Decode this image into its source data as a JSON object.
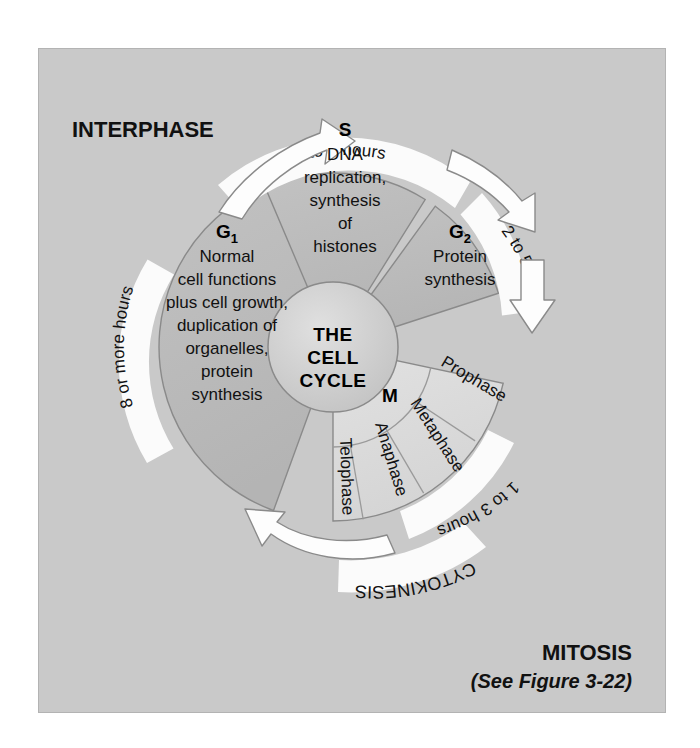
{
  "figure": {
    "background_color": "#c9c9c9",
    "panel_border_color": "#b3b3b3"
  },
  "headings": {
    "interphase": "INTERPHASE",
    "mitosis": "MITOSIS",
    "mitosis_note": "(See Figure 3-22)",
    "cytokinesis": "CYTOKINESIS"
  },
  "hub": {
    "line1": "THE",
    "line2": "CELL",
    "line3": "CYCLE"
  },
  "phases": {
    "g1": {
      "letter": "G",
      "subscript": "1",
      "duration": "8 or more hours",
      "lines": [
        "Normal",
        "cell functions",
        "plus cell growth,",
        "duplication of",
        "organelles,",
        "protein",
        "synthesis"
      ]
    },
    "s": {
      "letter": "S",
      "subscript": "",
      "duration": "6 to 8 hours",
      "lines": [
        "DNA",
        "replication,",
        "synthesis",
        "of",
        "histones"
      ]
    },
    "g2": {
      "letter": "G",
      "subscript": "2",
      "duration": "2 to 5 hours",
      "lines": [
        "Protein",
        "synthesis"
      ]
    },
    "m": {
      "letter": "M",
      "subscript": "",
      "duration": "1 to 3 hours",
      "subphases": [
        "Prophase",
        "Metaphase",
        "Anaphase",
        "Telophase"
      ]
    }
  },
  "colors": {
    "interphase_fill": "#bcbcbc",
    "mitosis_fill": "#dcdcdc",
    "hub_fill": "#cccccc",
    "band_fill": "#fbfbfb",
    "stroke": "#8a8a8a",
    "arrow_fill": "#fdfdfd",
    "arrow_stroke": "#8a8a8a"
  }
}
